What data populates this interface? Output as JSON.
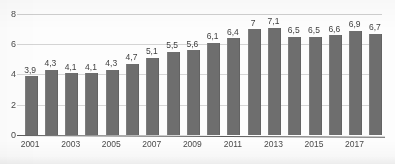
{
  "chart_data": {
    "type": "bar",
    "title": "",
    "subtitle": "",
    "xlabel": "",
    "ylabel": "",
    "ylim": [
      0,
      8
    ],
    "yticks": [
      "0",
      "2",
      "4",
      "6",
      "8"
    ],
    "grid": true,
    "legend": false,
    "legend_position": "none",
    "decimal_separator": ",",
    "bar_color": "#6e6e6e",
    "gridline_color": "#d4d4d4",
    "axis_color": "#5a5a5a",
    "categories": [
      "2001",
      "2002",
      "2003",
      "2004",
      "2005",
      "2006",
      "2007",
      "2008",
      "2009",
      "2010",
      "2011",
      "2012",
      "2013",
      "2014",
      "2015",
      "2016",
      "2017",
      "2018"
    ],
    "visible_xticks": [
      "2001",
      "2003",
      "2005",
      "2007",
      "2009",
      "2011",
      "2013",
      "2015",
      "2017"
    ],
    "values": [
      3.9,
      4.3,
      4.1,
      4.1,
      4.3,
      4.7,
      5.1,
      5.5,
      5.6,
      6.1,
      6.4,
      7,
      7.1,
      6.5,
      6.5,
      6.6,
      6.9,
      6.7
    ],
    "data_labels": [
      "3,9",
      "4,3",
      "4,1",
      "4,1",
      "4,3",
      "4,7",
      "5,1",
      "5,5",
      "5,6",
      "6,1",
      "6,4",
      "7",
      "7,1",
      "6,5",
      "6,5",
      "6,6",
      "6,9",
      "6,7"
    ]
  }
}
